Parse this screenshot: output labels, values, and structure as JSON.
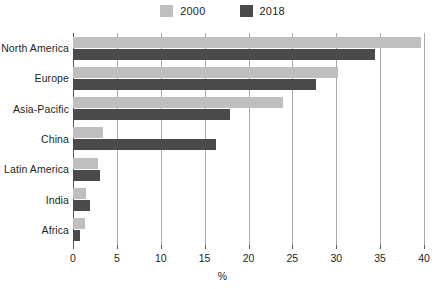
{
  "chart_data": {
    "type": "bar",
    "orientation": "horizontal",
    "title": "",
    "xlabel": "%",
    "ylabel": "",
    "xlim": [
      0,
      40
    ],
    "xticks": [
      0,
      5,
      10,
      15,
      20,
      25,
      30,
      35,
      40
    ],
    "grid": "vertical",
    "legend_position": "top-center",
    "categories": [
      "North America",
      "Europe",
      "Asia-Pacific",
      "China",
      "Latin America",
      "India",
      "Africa"
    ],
    "series": [
      {
        "name": "2000",
        "color": "#bfbfbf",
        "values": [
          39.7,
          30.2,
          23.9,
          3.4,
          2.8,
          1.5,
          1.4
        ]
      },
      {
        "name": "2018",
        "color": "#4a4a4a",
        "values": [
          34.4,
          27.7,
          17.9,
          16.3,
          3.1,
          1.9,
          0.8
        ]
      }
    ]
  },
  "legend": {
    "entries": [
      {
        "label": "2000",
        "color": "#bfbfbf"
      },
      {
        "label": "2018",
        "color": "#4a4a4a"
      }
    ]
  },
  "axis": {
    "x_title": "%",
    "tick_labels": [
      "0",
      "5",
      "10",
      "15",
      "20",
      "25",
      "30",
      "35",
      "40"
    ]
  },
  "colors": {
    "series_2000": "#bfbfbf",
    "series_2018": "#4a4a4a",
    "axis": "#58595b",
    "gridline": "#a7a9ac",
    "text": "#231f20",
    "background": "#ffffff"
  }
}
